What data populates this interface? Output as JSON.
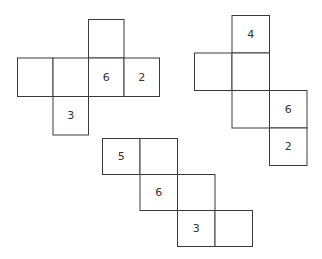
{
  "nets": [
    {
      "name": "net-cross",
      "cells": [
        {
          "row": 0,
          "col": 2,
          "label": ""
        },
        {
          "row": 1,
          "col": 0,
          "label": ""
        },
        {
          "row": 1,
          "col": 1,
          "label": ""
        },
        {
          "row": 1,
          "col": 2,
          "label": "6"
        },
        {
          "row": 1,
          "col": 3,
          "label": "2"
        },
        {
          "row": 2,
          "col": 1,
          "label": "3"
        }
      ]
    },
    {
      "name": "net-zigzag-vertical",
      "cells": [
        {
          "row": 0,
          "col": 1,
          "label": "4"
        },
        {
          "row": 1,
          "col": 0,
          "label": ""
        },
        {
          "row": 1,
          "col": 1,
          "label": ""
        },
        {
          "row": 2,
          "col": 1,
          "label": ""
        },
        {
          "row": 2,
          "col": 2,
          "label": "6"
        },
        {
          "row": 3,
          "col": 2,
          "label": "2"
        }
      ]
    },
    {
      "name": "net-staircase",
      "cells": [
        {
          "row": 0,
          "col": 0,
          "label": "5"
        },
        {
          "row": 0,
          "col": 1,
          "label": ""
        },
        {
          "row": 1,
          "col": 1,
          "label": "6"
        },
        {
          "row": 1,
          "col": 2,
          "label": ""
        },
        {
          "row": 2,
          "col": 2,
          "label": "3"
        },
        {
          "row": 2,
          "col": 3,
          "label": ""
        }
      ]
    }
  ]
}
